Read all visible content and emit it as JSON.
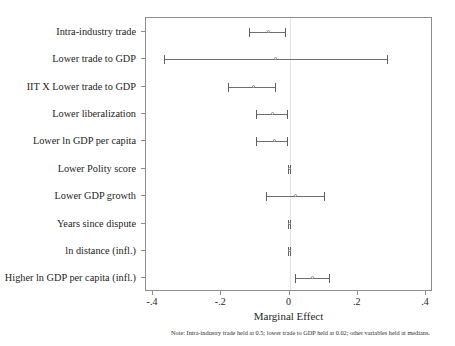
{
  "chart_data": {
    "type": "scatter",
    "orientation": "horizontal",
    "title": "",
    "xlabel": "Marginal Effect",
    "ylabel": "",
    "xlim": [
      -0.4,
      0.4
    ],
    "xticks": [
      -0.4,
      -0.2,
      0,
      0.2,
      0.4
    ],
    "xticklabels": [
      "-.4",
      "-.2",
      "0",
      ".2",
      ".4"
    ],
    "grid": false,
    "legend": null,
    "zero_reference_line": 0,
    "note": "Note: Intra-industry trade held at 0.5; lower trade to GDP held at 0.02; other variables held at medians.",
    "categories": [
      "Intra-industry trade",
      "Lower trade to GDP",
      "IIT X Lower trade to GDP",
      "Lower liberalization",
      "Lower ln GDP per capita",
      "Lower Polity score",
      "Lower GDP growth",
      "Years since dispute",
      "ln distance (infl.)",
      "Higher ln GDP per capita (infl.)"
    ],
    "points": [
      {
        "label": "Intra-industry trade",
        "estimate": -0.06,
        "ci_low": -0.12,
        "ci_high": -0.011
      },
      {
        "label": "Lower trade to GDP",
        "estimate": -0.04,
        "ci_low": -0.368,
        "ci_high": 0.288
      },
      {
        "label": "IIT X Lower trade to GDP",
        "estimate": -0.105,
        "ci_low": -0.18,
        "ci_high": -0.039
      },
      {
        "label": "Lower liberalization",
        "estimate": -0.048,
        "ci_low": -0.098,
        "ci_high": -0.004
      },
      {
        "label": "Lower ln GDP per capita",
        "estimate": -0.043,
        "ci_low": -0.098,
        "ci_high": -0.005
      },
      {
        "label": "Lower Polity score",
        "estimate": 0.0,
        "ci_low": -0.004,
        "ci_high": 0.004
      },
      {
        "label": "Lower GDP growth",
        "estimate": 0.018,
        "ci_low": -0.068,
        "ci_high": 0.104
      },
      {
        "label": "Years since dispute",
        "estimate": 0.0,
        "ci_low": -0.003,
        "ci_high": 0.003
      },
      {
        "label": "ln distance (infl.)",
        "estimate": 0.0,
        "ci_low": -0.004,
        "ci_high": 0.004
      },
      {
        "label": "Higher ln GDP per capita (infl.)",
        "estimate": 0.068,
        "ci_low": 0.017,
        "ci_high": 0.118
      }
    ]
  }
}
